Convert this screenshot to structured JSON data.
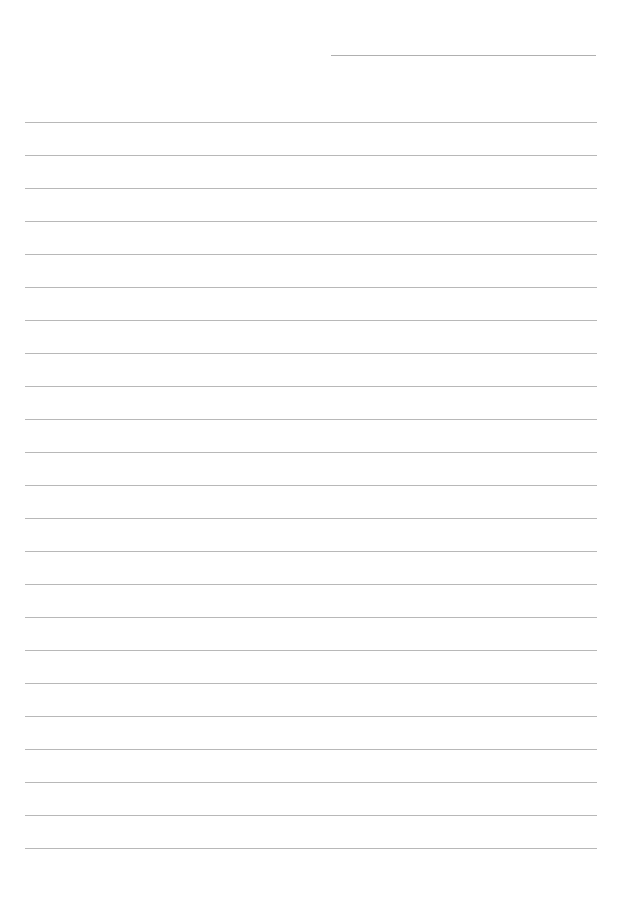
{
  "document": {
    "type": "lined-paper",
    "background": "#ffffff",
    "rule_color": "#b8b8b8",
    "date_line": {
      "x1": 331,
      "x2": 596,
      "y": 55
    },
    "rules": {
      "x1": 25,
      "x2": 597,
      "first_y": 122,
      "spacing": 33,
      "count": 23
    }
  }
}
